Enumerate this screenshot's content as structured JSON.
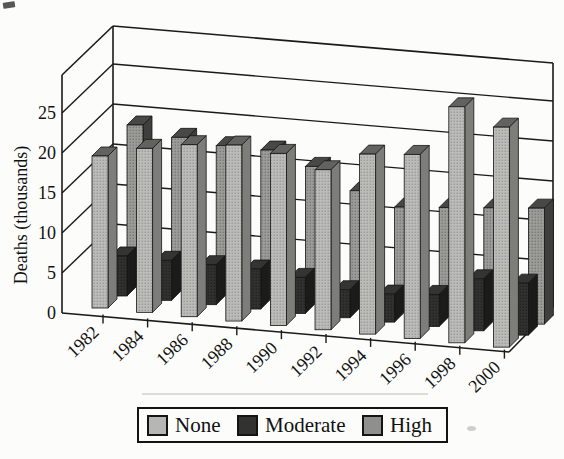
{
  "figure": {
    "background": "#fcfcfa"
  },
  "y_axis": {
    "title": "Deaths (thousands)",
    "tick_labels": [
      "0",
      "5",
      "10",
      "15",
      "20",
      "25"
    ]
  },
  "x_axis": {
    "labels": [
      "1982",
      "1984",
      "1986",
      "1988",
      "1990",
      "1992",
      "1994",
      "1996",
      "1998",
      "2000"
    ]
  },
  "legend": {
    "items": [
      {
        "label": "None",
        "color": "#b6b6b4"
      },
      {
        "label": "Moderate",
        "color": "#323230"
      },
      {
        "label": "High",
        "color": "#8f8f8d"
      }
    ]
  },
  "chart_data": {
    "type": "bar",
    "projection": "3d",
    "title": "",
    "xlabel": "",
    "ylabel": "Deaths (thousands)",
    "ylim": [
      0,
      30
    ],
    "yticks": [
      0,
      5,
      10,
      15,
      20,
      25
    ],
    "grid": true,
    "legend_position": "bottom",
    "categories": [
      "1982",
      "1984",
      "1986",
      "1988",
      "1990",
      "1992",
      "1994",
      "1996",
      "1998",
      "2000"
    ],
    "series": [
      {
        "name": "None",
        "color": "#b6b6b4",
        "values": [
          19,
          20.5,
          21.5,
          22,
          21.5,
          20,
          22.5,
          23,
          29.5,
          27.5
        ]
      },
      {
        "name": "Moderate",
        "color": "#323230",
        "values": [
          5,
          5,
          5,
          5,
          4.5,
          3.5,
          3.5,
          4,
          6.5,
          6.5
        ]
      },
      {
        "name": "High",
        "color": "#8f8f8d",
        "values": [
          20,
          19,
          18.5,
          18.5,
          17,
          14.5,
          13,
          13.5,
          14,
          14.5
        ]
      }
    ]
  }
}
